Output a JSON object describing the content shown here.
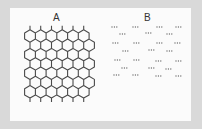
{
  "figure": {
    "panels": [
      {
        "id": "A",
        "label": "A",
        "description": "hexagonal honeycomb lattice with dangling bond stubs",
        "columns": 6,
        "rows": 7
      },
      {
        "id": "B",
        "label": "B",
        "description": "disordered array of three-dot clusters",
        "rows": 7
      }
    ]
  },
  "colors": {
    "frame": "#d9d9d9",
    "background": "#fbfbfb",
    "lattice": "#4a4a4a",
    "dots": "#6a6a6a"
  },
  "panel_b_clusters": [
    [
      [
        112,
        27
      ],
      [
        133,
        27
      ],
      [
        157,
        27
      ],
      [
        176,
        27
      ]
    ],
    [
      [
        120,
        34
      ],
      [
        146,
        33
      ],
      [
        167,
        34
      ]
    ],
    [
      [
        113,
        43
      ],
      [
        134,
        43
      ],
      [
        157,
        43
      ],
      [
        175,
        43
      ]
    ],
    [
      [
        123,
        51
      ],
      [
        149,
        50
      ],
      [
        167,
        51
      ]
    ],
    [
      [
        115,
        60
      ],
      [
        134,
        60
      ],
      [
        156,
        61
      ],
      [
        176,
        61
      ]
    ],
    [
      [
        122,
        68
      ],
      [
        149,
        68
      ],
      [
        166,
        69
      ]
    ],
    [
      [
        114,
        75
      ],
      [
        133,
        75
      ],
      [
        156,
        76
      ],
      [
        176,
        76
      ]
    ]
  ]
}
